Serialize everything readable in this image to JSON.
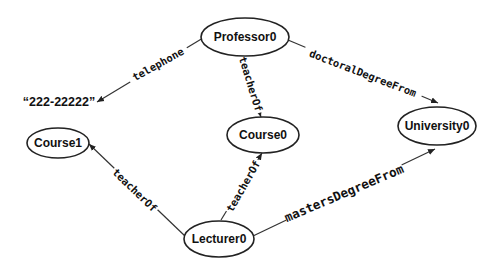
{
  "diagram": {
    "nodes": {
      "professor0": {
        "label": "Professor0"
      },
      "course0": {
        "label": "Course0"
      },
      "course1": {
        "label": "Course1"
      },
      "university0": {
        "label": "University0"
      },
      "lecturer0": {
        "label": "Lecturer0"
      },
      "telephone_literal": {
        "label": "“222-22222”"
      }
    },
    "edges": {
      "telephone": {
        "from": "Professor0",
        "to": "“222-22222”",
        "label": "telephone"
      },
      "prof_teacherOf": {
        "from": "Professor0",
        "to": "Course0",
        "label": "teacherOf"
      },
      "doctoralDegreeFrom": {
        "from": "Professor0",
        "to": "University0",
        "label": "doctoralDegreeFrom"
      },
      "lect_teacherOf_course1": {
        "from": "Lecturer0",
        "to": "Course1",
        "label": "teacherOf"
      },
      "lect_teacherOf_course0": {
        "from": "Lecturer0",
        "to": "Course0",
        "label": "teacherOf"
      },
      "mastersDegreeFrom": {
        "from": "Lecturer0",
        "to": "University0",
        "label": "mastersDegreeFrom"
      }
    }
  }
}
